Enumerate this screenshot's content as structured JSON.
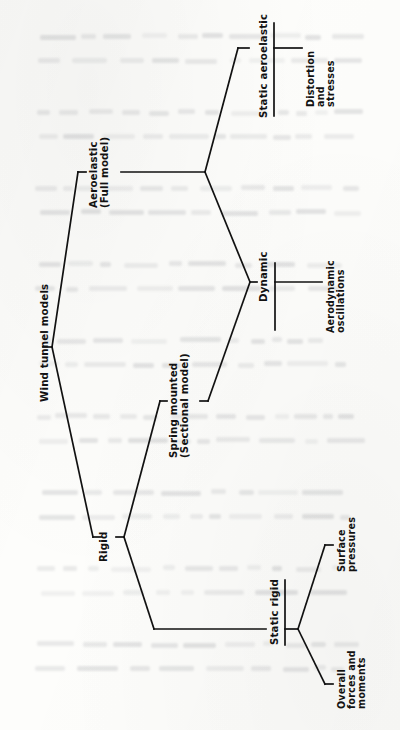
{
  "diagram": {
    "orientation": "rotated-90-ccw",
    "ink_color": "#111111",
    "paper_color": "#fdfdfb",
    "root": {
      "label": "Wind tunnel models"
    },
    "level1": [
      {
        "id": "aeroelastic",
        "label": "Aeroelastic\n(Full model)"
      },
      {
        "id": "rigid",
        "label": "Rigid"
      }
    ],
    "level2": [
      {
        "id": "static-aeroelastic",
        "label": "Static aeroelastic",
        "underlined": true
      },
      {
        "id": "dynamic",
        "label": "Dynamic",
        "underlined": true
      },
      {
        "id": "spring-mounted",
        "label": "Spring mounted\n(Sectional model)"
      },
      {
        "id": "static-rigid",
        "label": "Static rigid",
        "underlined": true
      }
    ],
    "leaves": [
      {
        "id": "distortion-and-stresses",
        "label": "Distortion\nand\nstresses"
      },
      {
        "id": "aerodynamic-oscillations",
        "label": "Aerodynamic\noscillations"
      },
      {
        "id": "surface-pressures",
        "label": "Surface\npressures"
      },
      {
        "id": "overall-forces-and-moments",
        "label": "Overall\nforces and\nmoments"
      }
    ]
  }
}
